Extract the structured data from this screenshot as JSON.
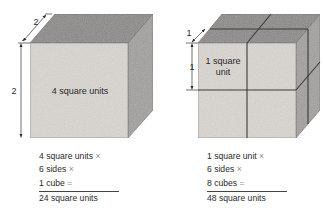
{
  "colors": {
    "front_face": "#d9d6d1",
    "top_face": "#8d8b88",
    "side_face": "#a3a19e",
    "edge": "#555555",
    "grid_line": "#3a3a3a",
    "text": "#2a2a2a",
    "operator": "#8a8a8a"
  },
  "left_cube": {
    "depth_label": "2",
    "height_label": "2",
    "face_label": "4 square units",
    "calculation": {
      "lines": [
        {
          "text": "4 square units",
          "op": "×"
        },
        {
          "text": "6 sides",
          "op": "×"
        },
        {
          "text": "1 cube",
          "op": "="
        }
      ],
      "result": "24 square units"
    }
  },
  "right_cube": {
    "depth_label": "1",
    "height_label": "1",
    "face_label_line1": "1 square",
    "face_label_line2": "unit",
    "calculation": {
      "lines": [
        {
          "text": "1 square unit",
          "op": "×"
        },
        {
          "text": "6 sides",
          "op": "×"
        },
        {
          "text": "8 cubes",
          "op": "="
        }
      ],
      "result": "48 square units"
    }
  }
}
